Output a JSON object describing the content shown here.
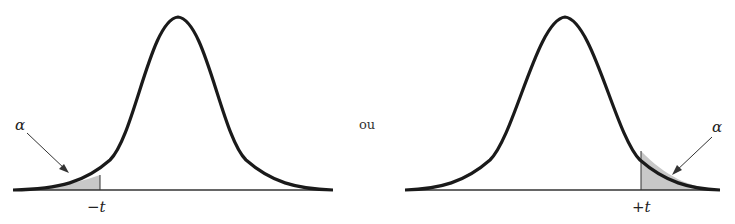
{
  "figure": {
    "left_panel": {
      "alpha_label": "α",
      "t_label": "−t",
      "tail": "left"
    },
    "separator": "ou",
    "right_panel": {
      "alpha_label": "α",
      "t_label": "+t",
      "tail": "right"
    }
  },
  "colors": {
    "curve": "#1a1a1a",
    "shade": "#c8c8c8",
    "axis": "#333333"
  }
}
